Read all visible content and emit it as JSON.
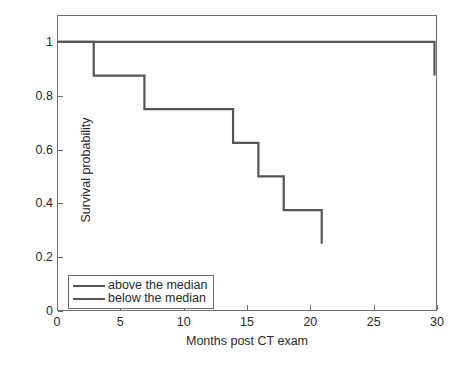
{
  "chart_data": {
    "type": "line",
    "title": "",
    "xlabel": "Months post CT exam",
    "ylabel": "Survival probability",
    "xlim": [
      0,
      30
    ],
    "ylim": [
      0,
      1.1
    ],
    "xticks": [
      0,
      5,
      10,
      15,
      20,
      25,
      30
    ],
    "xtick_labels": [
      "0",
      "5",
      "10",
      "15",
      "20",
      "25",
      "30"
    ],
    "yticks": [
      0,
      0.2,
      0.4,
      0.6,
      0.8,
      1
    ],
    "ytick_labels": [
      "0",
      "0.2",
      "0.4",
      "0.6",
      "0.8",
      "1"
    ],
    "grid": false,
    "legend_position": "lower left",
    "line_color": "#555555",
    "axis_color": "#6e6e6e",
    "step_style": "post",
    "series": [
      {
        "name": "above the median",
        "x": [
          0,
          29.8,
          29.8
        ],
        "y": [
          1,
          1,
          0.875
        ],
        "steps": [
          {
            "time": 0,
            "survival": 1
          },
          {
            "time": 29.8,
            "survival": 0.875
          }
        ]
      },
      {
        "name": "below the median",
        "x": [
          0,
          2.9,
          2.9,
          6.9,
          6.9,
          13.9,
          13.9,
          15.9,
          15.9,
          17.9,
          17.9,
          20.9,
          20.9
        ],
        "y": [
          1,
          1,
          0.875,
          0.875,
          0.75,
          0.75,
          0.625,
          0.625,
          0.5,
          0.5,
          0.375,
          0.375,
          0.25
        ],
        "steps": [
          {
            "time": 0,
            "survival": 1
          },
          {
            "time": 2.9,
            "survival": 0.875
          },
          {
            "time": 6.9,
            "survival": 0.75
          },
          {
            "time": 13.9,
            "survival": 0.625
          },
          {
            "time": 15.9,
            "survival": 0.5
          },
          {
            "time": 17.9,
            "survival": 0.375
          },
          {
            "time": 20.9,
            "survival": 0.25
          }
        ]
      }
    ]
  },
  "axes": {
    "x_title": "Months post CT exam",
    "y_title": "Survival probability",
    "x_tick_labels": [
      "0",
      "5",
      "10",
      "15",
      "20",
      "25",
      "30"
    ],
    "y_tick_labels": [
      "0",
      "0.2",
      "0.4",
      "0.6",
      "0.8",
      "1"
    ]
  },
  "legend": {
    "entries": [
      {
        "label": "above the median"
      },
      {
        "label": "below the median"
      }
    ]
  }
}
